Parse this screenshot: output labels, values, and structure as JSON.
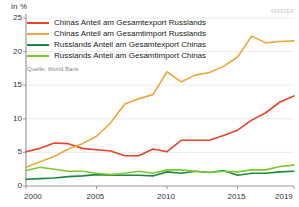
{
  "axis_unit_label": "in %",
  "watermark": "43002EX",
  "source": "Quelle: World Bank",
  "legend": {
    "items": [
      {
        "label": "Chinas Anteil am Gesamtexport Russlands",
        "color": "#E8442A"
      },
      {
        "label": "Chinas Anteil am Gesamtimport Russlands",
        "color": "#EFA63C"
      },
      {
        "label": "Russlands Anteil am Gesamtexport Chinas",
        "color": "#1B8A3F"
      },
      {
        "label": "Russlands Anteil am Gesamtimport Chinas",
        "color": "#7DC832"
      }
    ]
  },
  "chart_data": {
    "type": "line",
    "title": "",
    "subtitle": "",
    "xlabel": "",
    "ylabel": "in %",
    "xlim": [
      2000,
      2019
    ],
    "ylim": [
      0,
      25
    ],
    "yticks": [
      0,
      5,
      10,
      15,
      20,
      25
    ],
    "xticks": [
      2000,
      2005,
      2010,
      2015,
      2019
    ],
    "grid": true,
    "legend_position": "top-left",
    "x": [
      2000,
      2001,
      2002,
      2003,
      2004,
      2005,
      2006,
      2007,
      2008,
      2009,
      2010,
      2011,
      2012,
      2013,
      2014,
      2015,
      2016,
      2017,
      2018,
      2019
    ],
    "series": [
      {
        "name": "Chinas Anteil am Gesamtexport Russlands",
        "color": "#E8442A",
        "values": [
          5.1,
          5.6,
          6.4,
          6.3,
          5.6,
          5.4,
          5.2,
          4.5,
          4.5,
          5.5,
          5.1,
          6.8,
          6.8,
          6.8,
          7.5,
          8.3,
          9.8,
          10.9,
          12.5,
          13.4
        ]
      },
      {
        "name": "Chinas Anteil am Gesamtimport Russlands",
        "color": "#EFA63C",
        "values": [
          2.8,
          3.6,
          4.4,
          5.5,
          6.3,
          7.4,
          9.4,
          12.2,
          13.0,
          13.6,
          17.0,
          15.5,
          16.5,
          16.9,
          17.8,
          19.2,
          22.3,
          21.3,
          21.5,
          21.6
        ]
      },
      {
        "name": "Russlands Anteil am Gesamtexport Chinas",
        "color": "#1B8A3F",
        "values": [
          1.0,
          1.1,
          1.2,
          1.4,
          1.5,
          1.7,
          1.6,
          1.6,
          1.6,
          1.5,
          2.1,
          1.9,
          2.2,
          2.0,
          2.3,
          1.6,
          1.9,
          1.9,
          2.1,
          2.2
        ]
      },
      {
        "name": "Russlands Anteil am Gesamtimport Chinas",
        "color": "#7DC832",
        "values": [
          2.3,
          2.8,
          2.5,
          2.2,
          2.2,
          1.9,
          1.7,
          1.9,
          2.2,
          1.9,
          2.4,
          2.4,
          2.2,
          2.0,
          2.2,
          2.1,
          2.4,
          2.4,
          2.9,
          3.1
        ]
      }
    ]
  }
}
